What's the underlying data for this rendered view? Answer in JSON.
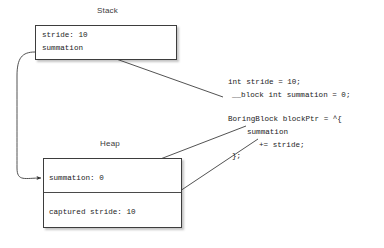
{
  "diagram": {
    "background_color": "#ffffff",
    "line_color": "#333333",
    "box_border_color": "#3d3d3d",
    "text_color": "#1c1c1c",
    "label_color": "#3a3a3a"
  },
  "regions": [
    {
      "name": "stack",
      "label": "Stack",
      "slots": [
        {
          "name": "stack-slot-stride",
          "text": "stride: 10"
        },
        {
          "name": "stack-slot-summation",
          "text": "summation"
        }
      ]
    },
    {
      "name": "heap",
      "label": "Heap",
      "slots": [
        {
          "name": "heap-slot-summation",
          "text": "summation: 0"
        },
        {
          "name": "heap-slot-captured-stride",
          "text": "captured stride: 10"
        }
      ]
    }
  ],
  "code_blocks": [
    {
      "name": "declaration-code",
      "lines": [
        "int stride = 10;",
        "__block int summation = 0;"
      ]
    },
    {
      "name": "block-literal-code",
      "lines": [
        "BoringBlock blockPtr = ^{",
        "summation",
        "+= stride;",
        "};"
      ]
    }
  ],
  "arrows": [
    {
      "name": "arrow-summation-decl-to-stack-slot",
      "from": "__block int summation = 0;",
      "to": "stack summation slot"
    },
    {
      "name": "arrow-stack-summation-to-heap-summation",
      "from": "stack summation slot",
      "to": "heap summation: 0 slot"
    },
    {
      "name": "arrow-block-summation-to-heap-summation",
      "from": "block body summation",
      "to": "heap summation: 0 slot"
    },
    {
      "name": "arrow-block-stride-to-heap-captured-stride",
      "from": "block body += stride;",
      "to": "heap captured stride: 10 slot"
    }
  ]
}
